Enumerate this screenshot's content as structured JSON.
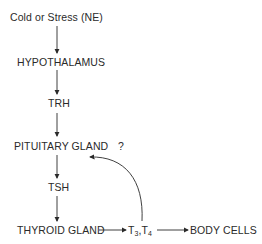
{
  "diagram": {
    "nodes": {
      "stimulus": "Cold or Stress (NE)",
      "hypothalamus": "HYPOTHALAMUS",
      "trh": "TRH",
      "pituitary": "PITUITARY GLAND",
      "question": "?",
      "tsh": "TSH",
      "thyroid": "THYROID GLAND",
      "t3": "T",
      "t3_sub": "3",
      "sep": ",T",
      "t4_sub": "4",
      "body_cells": "BODY CELLS"
    },
    "edges": [
      {
        "from": "Cold or Stress (NE)",
        "to": "HYPOTHALAMUS"
      },
      {
        "from": "HYPOTHALAMUS",
        "to": "TRH"
      },
      {
        "from": "TRH",
        "to": "PITUITARY GLAND"
      },
      {
        "from": "PITUITARY GLAND",
        "to": "TSH"
      },
      {
        "from": "TSH",
        "to": "THYROID GLAND"
      },
      {
        "from": "THYROID GLAND",
        "to": "T3,T4"
      },
      {
        "from": "T3,T4",
        "to": "BODY CELLS"
      },
      {
        "from": "T3,T4",
        "to": "PITUITARY GLAND",
        "type": "feedback"
      }
    ],
    "colors": {
      "ink": "#2a2a2a",
      "background": "#ffffff"
    }
  }
}
